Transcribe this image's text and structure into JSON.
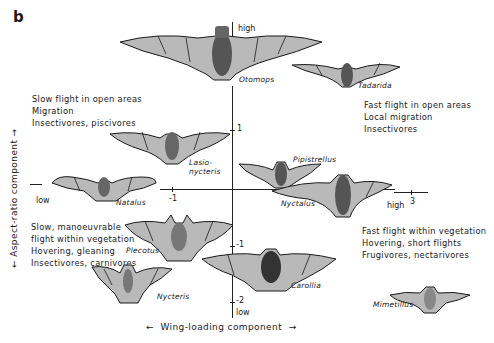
{
  "figure": {
    "panel_label": "b",
    "x_axis": {
      "label": "Wing-loading component",
      "left_arrow": "←",
      "right_arrow": "→",
      "ticks": [
        {
          "label": "-1"
        },
        {
          "label": "3"
        }
      ],
      "low_label": "low",
      "high_label": "high"
    },
    "y_axis": {
      "label": "Aspect-ratio component",
      "ticks": [
        {
          "label": "1"
        },
        {
          "label": "-1"
        },
        {
          "label": "-2"
        }
      ],
      "high_label": "high",
      "low_label": "low"
    },
    "quadrants": {
      "top_left": [
        "Slow flight in open areas",
        "Migration",
        "Insectivores, piscivores"
      ],
      "top_right": [
        "Fast flight in open areas",
        "Local migration",
        "Insectivores"
      ],
      "bottom_left": [
        "Slow, manoeuvrable",
        "flight within vegetation",
        "Hovering, gleaning",
        "Insectivores, carnivores"
      ],
      "bottom_right": [
        "Fast flight within vegetation",
        "Hovering, short flights",
        "Frugivores, nectarivores"
      ]
    },
    "species": {
      "otomops": "Otomops",
      "tadarida": "Tadarida",
      "lasionycteris_1": "Lasio-",
      "lasionycteris_2": "nycteris",
      "pipistrellus": "Pipistrellus",
      "natalus": "Natalus",
      "nyctalus": "Nyctalus",
      "plecotus": "Plecotus",
      "carollia": "Carollia",
      "nycteris": "Nycteris",
      "mimetillus": "Mimetillus"
    },
    "colors": {
      "ink": "#1a1a1a",
      "wing_fill": "#b9b9b9",
      "body_fill": "#555555",
      "background": "#ffffff"
    }
  }
}
